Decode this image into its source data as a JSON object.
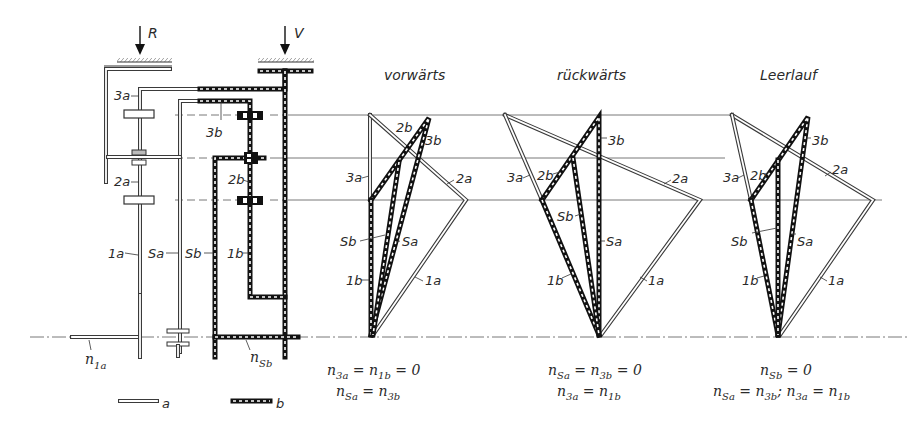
{
  "diagram": {
    "forces": {
      "R": "R",
      "V": "V"
    },
    "schematic_labels": {
      "l3a": "3a",
      "l2a": "2a",
      "l1a": "1a",
      "l3b": "3b",
      "l2b": "2b",
      "l1b": "1b",
      "lSa": "Sa",
      "lSb": "Sb"
    },
    "shaft_speeds": {
      "n1a": {
        "base": "n",
        "sub": "1a"
      },
      "nSb": {
        "base": "n",
        "sub": "Sb"
      }
    },
    "legend": [
      {
        "key": "a",
        "style": "double-line (hollow)",
        "label": "a"
      },
      {
        "key": "b",
        "style": "dashed-black (checkered)",
        "label": "b"
      }
    ],
    "speed_diagrams": [
      {
        "title": "vorwärts",
        "labels": {
          "2b": "2b",
          "3b": "3b",
          "3a": "3a",
          "2a": "2a",
          "Sb": "Sb",
          "Sa": "Sa",
          "1b": "1b",
          "1a": "1a"
        },
        "equations": [
          "n₃ₐ = n₁ᵦ = 0",
          "nₛₐ = n₃ᵦ"
        ],
        "eq_line1": {
          "lhs": "n",
          "lhs_sub": "3a",
          "mid": " = n",
          "mid_sub": "1b",
          "rhs": " = 0"
        },
        "eq_line2": {
          "lhs": "n",
          "lhs_sub": "Sa",
          "mid": " = n",
          "mid_sub": "3b",
          "rhs": ""
        }
      },
      {
        "title": "rückwärts",
        "labels": {
          "2b": "2b",
          "3b": "3b",
          "3a": "3a",
          "2a": "2a",
          "Sb": "Sb",
          "Sa": "Sa",
          "1b": "1b",
          "1a": "1a"
        },
        "equations": [
          "nₛₐ = n₃ᵦ = 0",
          "n₃ₐ = n₁ᵦ"
        ],
        "eq_line1": {
          "lhs": "n",
          "lhs_sub": "Sa",
          "mid": " = n",
          "mid_sub": "3b",
          "rhs": " = 0"
        },
        "eq_line2": {
          "lhs": "n",
          "lhs_sub": "3a",
          "mid": " = n",
          "mid_sub": "1b",
          "rhs": ""
        }
      },
      {
        "title": "Leerlauf",
        "labels": {
          "2b": "2b",
          "3b": "3b",
          "3a": "3a",
          "2a": "2a",
          "Sb": "Sb",
          "Sa": "Sa",
          "1b": "1b",
          "1a": "1a"
        },
        "equations": [
          "nₛᵦ = 0",
          "nₛₐ = n₃ᵦ;  n₃ₐ = n₁ᵦ"
        ],
        "eq_line1": {
          "lhs": "n",
          "lhs_sub": "Sb",
          "rhs": " = 0"
        },
        "eq_line2": {
          "lhs": "n",
          "lhs_sub": "Sa",
          "mid": " = n",
          "mid_sub": "3b",
          "sep": ";  n",
          "sep_sub": "3a",
          "rhs": " = n",
          "rhs_sub": "1b"
        }
      }
    ]
  }
}
